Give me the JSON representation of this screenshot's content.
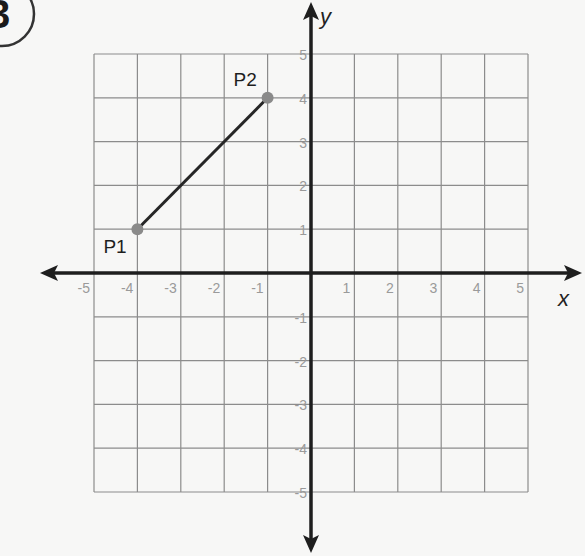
{
  "problem": {
    "number": "3"
  },
  "chart_data": {
    "type": "line",
    "title": "",
    "xlabel": "x",
    "ylabel": "y",
    "xlim": [
      -5,
      5
    ],
    "ylim": [
      -5,
      5
    ],
    "grid": true,
    "x_ticks": [
      -5,
      -4,
      -3,
      -2,
      -1,
      1,
      2,
      3,
      4,
      5
    ],
    "y_ticks": [
      5,
      4,
      3,
      2,
      1,
      -1,
      -2,
      -3,
      -4,
      -5
    ],
    "points": [
      {
        "label": "P1",
        "x": -4,
        "y": 1
      },
      {
        "label": "P2",
        "x": -1,
        "y": 4
      }
    ],
    "segments": [
      {
        "from": "P1",
        "to": "P2"
      }
    ],
    "colors": {
      "grid": "#8c8c8c",
      "axis": "#1e1e1e",
      "segment": "#262626",
      "point": "#8a8a8a",
      "tick_label": "#9a9a9a"
    }
  }
}
